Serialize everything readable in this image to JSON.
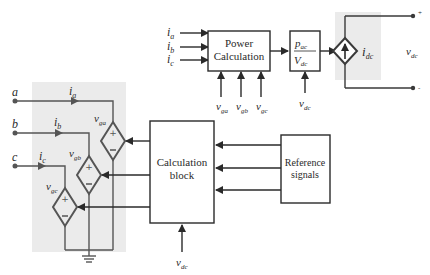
{
  "diagram": {
    "shaded_regions": [
      "three-phase dependent voltage sources",
      "dc dependent current source"
    ],
    "colors": {
      "line": "#3a3a3a",
      "shade": "#e8e8e8",
      "source_stroke": "#555555"
    },
    "blocks": {
      "power_calc": {
        "line1": "Power",
        "line2": "Calculation"
      },
      "divider": {
        "numerator": "p",
        "numerator_sub": "ac",
        "denominator": "V",
        "denominator_sub": "dc"
      },
      "calc_block": {
        "line1": "Calculation",
        "line2": "block"
      },
      "reference": {
        "line1": "Reference",
        "line2": "signals"
      }
    },
    "inputs_power_calc": [
      {
        "base": "i",
        "sub": "a"
      },
      {
        "base": "i",
        "sub": "b"
      },
      {
        "base": "i",
        "sub": "c"
      }
    ],
    "voltage_inputs": [
      {
        "base": "v",
        "sub": "ga"
      },
      {
        "base": "v",
        "sub": "gb"
      },
      {
        "base": "v",
        "sub": "gc"
      }
    ],
    "divider_input": {
      "base": "v",
      "sub": "dc"
    },
    "calc_input": {
      "base": "v",
      "sub": "dc"
    },
    "dc_side": {
      "current": {
        "base": "i",
        "sub": "dc"
      },
      "voltage": {
        "base": "v",
        "sub": "dc"
      },
      "plus": "+",
      "minus": "-"
    },
    "ac_nodes": [
      "a",
      "b",
      "c"
    ],
    "ac_currents": [
      {
        "base": "i",
        "sub": "a"
      },
      {
        "base": "i",
        "sub": "b"
      },
      {
        "base": "i",
        "sub": "c"
      }
    ],
    "sources": [
      {
        "base": "v",
        "sub": "ga"
      },
      {
        "base": "v",
        "sub": "gb"
      },
      {
        "base": "v",
        "sub": "gc"
      }
    ]
  }
}
